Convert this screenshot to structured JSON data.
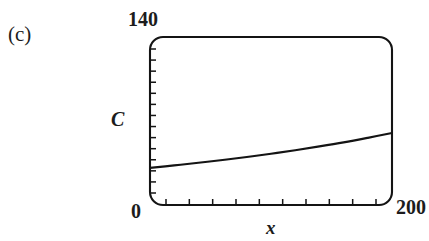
{
  "figure": {
    "panel_label": "(c)",
    "background_color": "#ffffff",
    "ink_color": "#141414"
  },
  "axes": {
    "y_axis_name": "C",
    "x_axis_name": "x",
    "y_max_label": "140",
    "y_min_label": "0",
    "x_max_label": "200",
    "x_min_label": ""
  },
  "chart_data": {
    "type": "line",
    "title": "(c)",
    "xlabel": "x",
    "ylabel": "C",
    "xlim": [
      0,
      200
    ],
    "ylim": [
      0,
      140
    ],
    "grid": false,
    "legend": null,
    "x_tick_labels": [
      "0",
      "200"
    ],
    "y_tick_labels": [
      "0",
      "140"
    ],
    "x_minor_tick_count": 10,
    "y_minor_tick_count": 14,
    "series": [
      {
        "name": "C(x)",
        "x": [
          0,
          20,
          40,
          60,
          80,
          100,
          120,
          140,
          160,
          180,
          200
        ],
        "values": [
          31.0,
          33.0,
          35.2,
          37.5,
          40.0,
          42.7,
          45.6,
          48.8,
          52.2,
          56.0,
          60.0
        ]
      }
    ]
  }
}
